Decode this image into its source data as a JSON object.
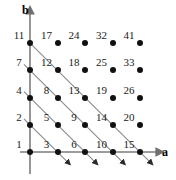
{
  "figure": {
    "title": "",
    "axes": {
      "x_label": "a",
      "y_label": "b"
    },
    "geometry": {
      "origin_x": 30,
      "origin_y": 152,
      "step_x": 27.5,
      "step_y": 27.2,
      "cols": 5,
      "rows": 5,
      "dot_radius": 3,
      "dot_color": "#111111",
      "axis_color": "#7b7b7b",
      "diagonal_color": "#8a8a8a",
      "label_color": "#1a1a1a"
    },
    "x_axis_arrow_tip": {
      "x": 157,
      "y": 152
    },
    "y_axis_arrow_tip": {
      "x": 30,
      "y": 13
    },
    "x_label_pos": {
      "x": 162,
      "y": 146
    },
    "y_label_pos": {
      "x": 22,
      "y": 4
    }
  },
  "chart_data": {
    "type": "scatter",
    "title": "",
    "xlabel": "a",
    "ylabel": "b",
    "xlim": [
      0,
      4
    ],
    "ylim": [
      0,
      4
    ],
    "grid": false,
    "legend": null,
    "points": [
      {
        "a": 0,
        "b": 0,
        "label": "1"
      },
      {
        "a": 1,
        "b": 0,
        "label": "3"
      },
      {
        "a": 2,
        "b": 0,
        "label": "6"
      },
      {
        "a": 3,
        "b": 0,
        "label": "10"
      },
      {
        "a": 4,
        "b": 0,
        "label": "15"
      },
      {
        "a": 0,
        "b": 1,
        "label": "2"
      },
      {
        "a": 1,
        "b": 1,
        "label": "5"
      },
      {
        "a": 2,
        "b": 1,
        "label": "9"
      },
      {
        "a": 3,
        "b": 1,
        "label": "14"
      },
      {
        "a": 4,
        "b": 1,
        "label": "20"
      },
      {
        "a": 0,
        "b": 2,
        "label": "4"
      },
      {
        "a": 1,
        "b": 2,
        "label": "8"
      },
      {
        "a": 2,
        "b": 2,
        "label": "13"
      },
      {
        "a": 3,
        "b": 2,
        "label": "19"
      },
      {
        "a": 4,
        "b": 2,
        "label": "26"
      },
      {
        "a": 0,
        "b": 3,
        "label": "7"
      },
      {
        "a": 1,
        "b": 3,
        "label": "12"
      },
      {
        "a": 2,
        "b": 3,
        "label": "18"
      },
      {
        "a": 3,
        "b": 3,
        "label": "25"
      },
      {
        "a": 4,
        "b": 3,
        "label": "33"
      },
      {
        "a": 0,
        "b": 4,
        "label": "11"
      },
      {
        "a": 1,
        "b": 4,
        "label": "17"
      },
      {
        "a": 2,
        "b": 4,
        "label": "24"
      },
      {
        "a": 3,
        "b": 4,
        "label": "32"
      },
      {
        "a": 4,
        "b": 4,
        "label": "41"
      }
    ],
    "diagonals": [
      {
        "sum": 1,
        "start_a": -0.22,
        "start_b": 1.22,
        "end_a": 1.35,
        "end_b": -0.35
      },
      {
        "sum": 2,
        "start_a": -0.22,
        "start_b": 2.22,
        "end_a": 2.35,
        "end_b": -0.35
      },
      {
        "sum": 3,
        "start_a": -0.22,
        "start_b": 3.22,
        "end_a": 3.35,
        "end_b": -0.35
      },
      {
        "sum": 4,
        "start_a": 0.0,
        "start_b": 4.0,
        "end_a": 4.35,
        "end_b": -0.35
      }
    ]
  }
}
